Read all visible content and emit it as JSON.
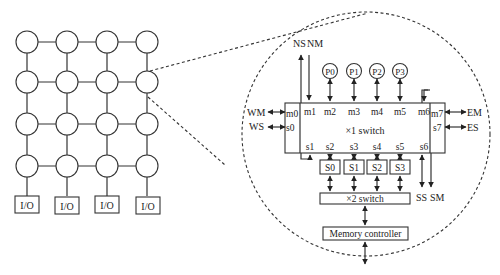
{
  "mesh": {
    "rows": 4,
    "cols": 4,
    "io_label": "I/O",
    "io_count": 4
  },
  "detail": {
    "north_labels": {
      "ns": "NS",
      "nm": "NM"
    },
    "processors": [
      "P0",
      "P1",
      "P2",
      "P3"
    ],
    "switch1": {
      "label": "×1 switch",
      "master_ports": [
        "m0",
        "m1",
        "m2",
        "m3",
        "m4",
        "m5",
        "m6",
        "m7"
      ],
      "slave_ports": [
        "s0",
        "s1",
        "s2",
        "s3",
        "s4",
        "s5",
        "s6",
        "s7"
      ]
    },
    "west_labels": {
      "wm": "WM",
      "ws": "WS"
    },
    "east_labels": {
      "em": "EM",
      "es": "ES"
    },
    "south_labels": {
      "ss": "SS",
      "sm": "SM"
    },
    "slaves": [
      "S0",
      "S1",
      "S2",
      "S3"
    ],
    "switch2": {
      "label": "×2 switch"
    },
    "memory_controller": {
      "label": "Memory controller"
    }
  }
}
